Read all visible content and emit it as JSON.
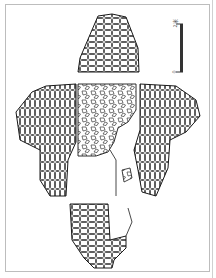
{
  "figure": {
    "type": "archaeological-plan-drawing",
    "line_color": "#1a1a1a",
    "frame_color": "#bdbdbd"
  },
  "scale_bar": {
    "top_label": "2米",
    "bottom_label": "0"
  },
  "regions": [
    {
      "name": "north-wall-segment",
      "label": ""
    },
    {
      "name": "west-wing",
      "label": ""
    },
    {
      "name": "central-rubble-area",
      "label": ""
    },
    {
      "name": "east-wing",
      "label": ""
    },
    {
      "name": "south-wall-segment",
      "label": ""
    }
  ]
}
